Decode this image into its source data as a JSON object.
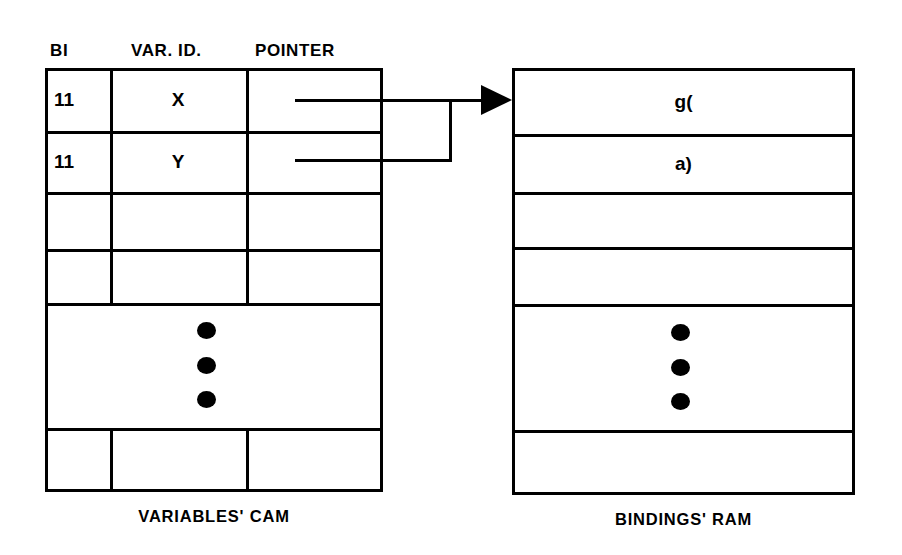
{
  "diagram": {
    "ink_color": "#000000",
    "background_color": "#ffffff"
  },
  "cam_table": {
    "caption": "VARIABLES' CAM",
    "headers": {
      "bi": "BI",
      "var_id": "VAR. ID.",
      "pointer": "POINTER"
    },
    "rows": [
      {
        "bi": "11",
        "var_id": "X",
        "pointer": "pointer-line"
      },
      {
        "bi": "11",
        "var_id": "Y",
        "pointer": "pointer-line"
      },
      {
        "bi": "",
        "var_id": "",
        "pointer": ""
      },
      {
        "bi": "",
        "var_id": "",
        "pointer": ""
      },
      {
        "bi": "",
        "var_id": "ellipsis",
        "pointer": ""
      },
      {
        "bi": "",
        "var_id": "",
        "pointer": ""
      }
    ]
  },
  "ram_table": {
    "caption": "BINDINGS' RAM",
    "rows": [
      {
        "value": "g("
      },
      {
        "value": "a)"
      },
      {
        "value": ""
      },
      {
        "value": ""
      },
      {
        "value": "ellipsis"
      },
      {
        "value": ""
      }
    ]
  },
  "connector": {
    "name": "pointer-arrow",
    "description": "Both pointer fields join a vertical bus and a single arrow targets the first Bindings' RAM row.",
    "arrowhead": "solid-triangle-right"
  },
  "ellipsis": {
    "glyph": "vertical-ellipsis",
    "dot_count": 3
  }
}
